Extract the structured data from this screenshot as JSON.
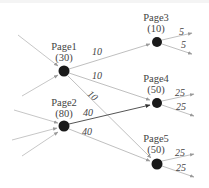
{
  "diagram": {
    "type": "pagerank-flow-graph",
    "colors": {
      "node": "#1a1a1a",
      "edge_light": "#b8b8b8",
      "edge_dark": "#555555",
      "text": "#444444"
    },
    "nodes": [
      {
        "id": "page1",
        "name": "Page1",
        "value": "(30)"
      },
      {
        "id": "page2",
        "name": "Page2",
        "value": "(80)"
      },
      {
        "id": "page3",
        "name": "Page3",
        "value": "(10)"
      },
      {
        "id": "page4",
        "name": "Page4",
        "value": "(50)"
      },
      {
        "id": "page5",
        "name": "Page5",
        "value": "(50)"
      }
    ],
    "edges": [
      {
        "from": "page1",
        "to": "page3",
        "label": "10"
      },
      {
        "from": "page1",
        "to": "page4",
        "label": "10"
      },
      {
        "from": "page1",
        "to": "page5",
        "label": "10"
      },
      {
        "from": "page2",
        "to": "page4",
        "label": "40"
      },
      {
        "from": "page2",
        "to": "page5",
        "label": "40"
      },
      {
        "from": "page3",
        "to": "out",
        "label": "5"
      },
      {
        "from": "page3",
        "to": "out",
        "label": "5"
      },
      {
        "from": "page4",
        "to": "out",
        "label": "25"
      },
      {
        "from": "page4",
        "to": "out",
        "label": "25"
      },
      {
        "from": "page5",
        "to": "out",
        "label": "25"
      },
      {
        "from": "page5",
        "to": "out",
        "label": "25"
      }
    ],
    "labels": {
      "e_1_3": "10",
      "e_1_4": "10",
      "e_1_5": "10",
      "e_2_4": "40",
      "e_2_5": "40",
      "e_3_a": "5",
      "e_3_b": "5",
      "e_4_a": "25",
      "e_4_b": "25",
      "e_5_a": "25",
      "e_5_b": "25"
    }
  }
}
